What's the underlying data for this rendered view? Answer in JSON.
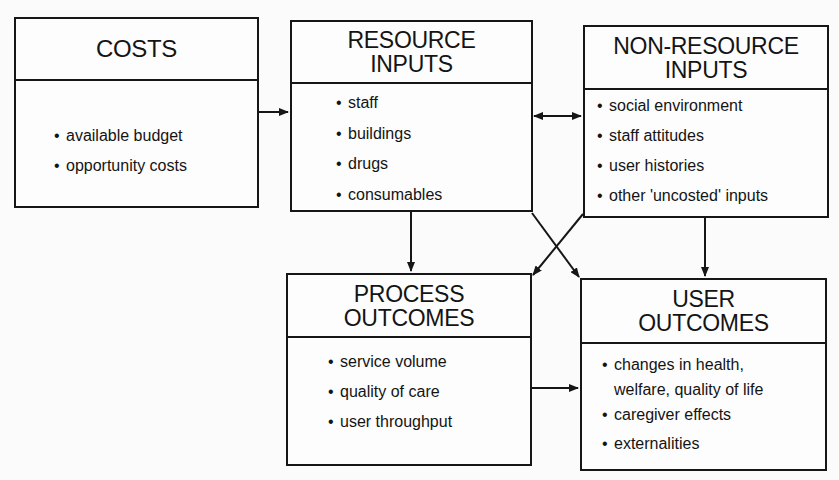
{
  "diagram": {
    "boxes": {
      "costs": {
        "title": [
          "COSTS"
        ],
        "items": [
          "available budget",
          "opportunity costs"
        ]
      },
      "resource_inputs": {
        "title": [
          "RESOURCE",
          "INPUTS"
        ],
        "items": [
          "staff",
          "buildings",
          "drugs",
          "consumables"
        ]
      },
      "non_resource_inputs": {
        "title": [
          "NON-RESOURCE",
          "INPUTS"
        ],
        "items": [
          "social environment",
          "staff attitudes",
          "user histories",
          "other 'uncosted' inputs"
        ]
      },
      "process_outcomes": {
        "title": [
          "PROCESS",
          "OUTCOMES"
        ],
        "items": [
          "service volume",
          "quality of care",
          "user throughput"
        ]
      },
      "user_outcomes": {
        "title": [
          "USER",
          "OUTCOMES"
        ],
        "items": [
          "changes in health,",
          "welfare, quality of life",
          "caregiver effects",
          "externalities"
        ]
      }
    },
    "connections": [
      {
        "from": "costs",
        "to": "resource_inputs",
        "type": "arrow"
      },
      {
        "from": "resource_inputs",
        "to": "non_resource_inputs",
        "type": "bidirectional"
      },
      {
        "from": "resource_inputs",
        "to": "process_outcomes",
        "type": "arrow"
      },
      {
        "from": "resource_inputs",
        "to": "user_outcomes",
        "type": "arrow"
      },
      {
        "from": "non_resource_inputs",
        "to": "process_outcomes",
        "type": "arrow"
      },
      {
        "from": "non_resource_inputs",
        "to": "user_outcomes",
        "type": "arrow"
      },
      {
        "from": "process_outcomes",
        "to": "user_outcomes",
        "type": "arrow"
      }
    ],
    "colors": {
      "line": "#161616",
      "background": "#fbfbfb"
    }
  }
}
